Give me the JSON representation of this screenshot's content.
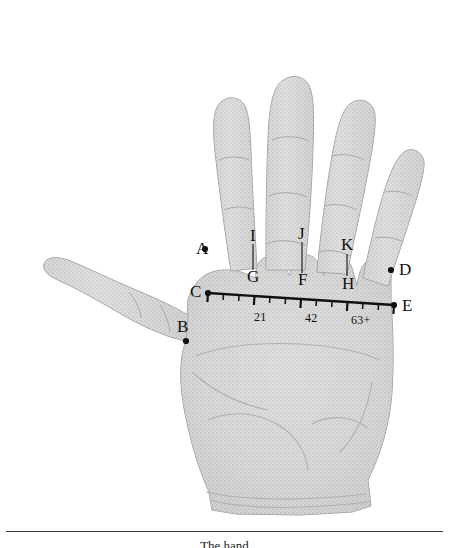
{
  "figure": {
    "caption_text": "The hand",
    "background_color": "#ffffff",
    "skin_tone_color": "#d9d9d9",
    "ink_color": "#111111",
    "rule_color": "#3a3a3a"
  },
  "points": [
    {
      "id": "A",
      "label": "A",
      "x": 196,
      "y": 249,
      "dot_x": 205,
      "dot_y": 249,
      "has_dot": true,
      "label_side": "left"
    },
    {
      "id": "B",
      "label": "B",
      "x": 177,
      "y": 327,
      "dot_x": 186,
      "dot_y": 341,
      "has_dot": true,
      "label_side": "left"
    },
    {
      "id": "C",
      "label": "C",
      "x": 190,
      "y": 292,
      "dot_x": 208,
      "dot_y": 293,
      "has_dot": true,
      "label_side": "left"
    },
    {
      "id": "D",
      "label": "D",
      "x": 399,
      "y": 270,
      "dot_x": 391,
      "dot_y": 270,
      "has_dot": true,
      "label_side": "right"
    },
    {
      "id": "E",
      "label": "E",
      "x": 402,
      "y": 306,
      "dot_x": 394,
      "dot_y": 305,
      "has_dot": true,
      "label_side": "right"
    },
    {
      "id": "F",
      "label": "F",
      "x": 298,
      "y": 280,
      "dot_x": null,
      "dot_y": null,
      "has_dot": false,
      "label_side": "center"
    },
    {
      "id": "G",
      "label": "G",
      "x": 247,
      "y": 277,
      "dot_x": null,
      "dot_y": null,
      "has_dot": false,
      "label_side": "center"
    },
    {
      "id": "H",
      "label": "H",
      "x": 342,
      "y": 284,
      "dot_x": null,
      "dot_y": null,
      "has_dot": false,
      "label_side": "center"
    },
    {
      "id": "I",
      "label": "I",
      "x": 250,
      "y": 236,
      "dot_x": null,
      "dot_y": null,
      "has_dot": false,
      "label_side": "center"
    },
    {
      "id": "J",
      "label": "J",
      "x": 298,
      "y": 234,
      "dot_x": null,
      "dot_y": null,
      "has_dot": false,
      "label_side": "center"
    },
    {
      "id": "K",
      "label": "K",
      "x": 341,
      "y": 245,
      "dot_x": null,
      "dot_y": null,
      "has_dot": false,
      "label_side": "center"
    }
  ],
  "leader_lines": [
    {
      "from": "I",
      "to": "G",
      "x1": 253,
      "y1": 244,
      "x2": 253,
      "y2": 270
    },
    {
      "from": "J",
      "to": "F",
      "x1": 302,
      "y1": 242,
      "x2": 302,
      "y2": 273
    },
    {
      "from": "K",
      "to": "H",
      "x1": 347,
      "y1": 254,
      "x2": 347,
      "y2": 276
    }
  ],
  "scale": {
    "name": "age-scale",
    "start_point": "C",
    "end_point": "E",
    "x1": 208,
    "y1": 293,
    "x2": 394,
    "y2": 305,
    "tick_count": 13,
    "major_tick_indices": [
      0,
      3,
      6,
      9,
      12
    ],
    "ticks": [
      {
        "index": 0,
        "t": 0.0,
        "major": true,
        "label": ""
      },
      {
        "index": 1,
        "t": 0.083,
        "major": false,
        "label": ""
      },
      {
        "index": 2,
        "t": 0.167,
        "major": false,
        "label": ""
      },
      {
        "index": 3,
        "t": 0.25,
        "major": true,
        "label": "21"
      },
      {
        "index": 4,
        "t": 0.333,
        "major": false,
        "label": ""
      },
      {
        "index": 5,
        "t": 0.417,
        "major": false,
        "label": ""
      },
      {
        "index": 6,
        "t": 0.5,
        "major": true,
        "label": "42"
      },
      {
        "index": 7,
        "t": 0.583,
        "major": false,
        "label": ""
      },
      {
        "index": 8,
        "t": 0.667,
        "major": false,
        "label": ""
      },
      {
        "index": 9,
        "t": 0.75,
        "major": true,
        "label": "63+"
      },
      {
        "index": 10,
        "t": 0.833,
        "major": false,
        "label": ""
      },
      {
        "index": 11,
        "t": 0.917,
        "major": false,
        "label": ""
      },
      {
        "index": 12,
        "t": 1.0,
        "major": true,
        "label": ""
      }
    ]
  },
  "scale_number_labels": [
    {
      "text": "21",
      "x": 254,
      "y": 311
    },
    {
      "text": "42",
      "x": 305,
      "y": 312
    },
    {
      "text": "63+",
      "x": 351,
      "y": 314
    }
  ],
  "rules": [
    {
      "name": "bottom-rule",
      "y": 531
    }
  ],
  "caption": {
    "text": "The hand",
    "y": 540
  }
}
